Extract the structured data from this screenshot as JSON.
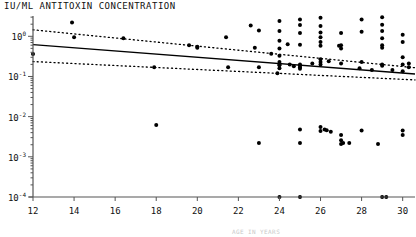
{
  "figure": {
    "title": "IU/ML  ANTITOXIN CONCENTRATION",
    "footnote": "AGE IN YEARS"
  },
  "axis_labels": {
    "y": [
      {
        "text": "10",
        "exp": "0"
      },
      {
        "text": "10",
        "exp": "-1"
      },
      {
        "text": "10",
        "exp": "-2"
      },
      {
        "text": "10",
        "exp": "-3"
      },
      {
        "text": "10",
        "exp": "-4"
      }
    ],
    "x": [
      "12",
      "14",
      "16",
      "18",
      "20",
      "22",
      "24",
      "26",
      "28",
      "30"
    ]
  },
  "colors": {
    "ink": "#111111",
    "axis": "#555555",
    "point": "#000000",
    "fit_line": "#000000",
    "ci_line": "#000000",
    "background": "#ffffff"
  },
  "chart_data": {
    "type": "scatter",
    "title": "IU/ML  ANTITOXIN CONCENTRATION",
    "xlabel": "",
    "ylabel": "IU/ML ANTITOXIN CONCENTRATION",
    "yscale": "log",
    "xlim": [
      12,
      30.6
    ],
    "ylim": [
      0.0001,
      3.2
    ],
    "xticks": [
      12,
      14,
      16,
      18,
      20,
      22,
      24,
      26,
      28,
      30
    ],
    "yticks": [
      1,
      0.1,
      0.01,
      0.001,
      0.0001
    ],
    "ytick_labels": [
      "10^0",
      "10^-1",
      "10^-2",
      "10^-3",
      "10^-4"
    ],
    "grid": false,
    "legend": null,
    "points": [
      [
        12.0,
        0.36
      ],
      [
        13.9,
        2.2
      ],
      [
        14.0,
        0.95
      ],
      [
        16.4,
        0.9
      ],
      [
        17.9,
        0.17
      ],
      [
        18.0,
        0.0062
      ],
      [
        19.6,
        0.6
      ],
      [
        20.0,
        0.52
      ],
      [
        20.0,
        0.55
      ],
      [
        21.4,
        0.95
      ],
      [
        21.5,
        0.17
      ],
      [
        22.6,
        1.85
      ],
      [
        22.8,
        0.52
      ],
      [
        23.0,
        1.4
      ],
      [
        23.0,
        0.17
      ],
      [
        23.0,
        0.0022
      ],
      [
        23.6,
        0.37
      ],
      [
        23.9,
        0.12
      ],
      [
        24.0,
        2.4
      ],
      [
        24.0,
        1.35
      ],
      [
        24.0,
        0.77
      ],
      [
        24.0,
        0.5
      ],
      [
        24.0,
        0.33
      ],
      [
        24.0,
        0.23
      ],
      [
        24.0,
        0.2
      ],
      [
        24.0,
        0.19
      ],
      [
        24.0,
        0.16
      ],
      [
        24.0,
        0.0001
      ],
      [
        24.4,
        0.63
      ],
      [
        24.5,
        0.2
      ],
      [
        24.7,
        0.18
      ],
      [
        25.0,
        2.6
      ],
      [
        25.0,
        1.9
      ],
      [
        25.0,
        1.2
      ],
      [
        25.0,
        0.62
      ],
      [
        25.0,
        0.2
      ],
      [
        25.0,
        0.185
      ],
      [
        25.0,
        0.17
      ],
      [
        25.0,
        0.155
      ],
      [
        25.0,
        0.0048
      ],
      [
        25.0,
        0.0022
      ],
      [
        25.0,
        0.0001
      ],
      [
        25.6,
        0.21
      ],
      [
        26.0,
        2.9
      ],
      [
        26.0,
        1.8
      ],
      [
        26.0,
        1.25
      ],
      [
        26.0,
        0.95
      ],
      [
        26.0,
        0.72
      ],
      [
        26.0,
        0.58
      ],
      [
        26.0,
        0.27
      ],
      [
        26.0,
        0.23
      ],
      [
        26.0,
        0.2
      ],
      [
        26.0,
        0.0055
      ],
      [
        26.0,
        0.0044
      ],
      [
        26.2,
        0.0048
      ],
      [
        26.3,
        0.0046
      ],
      [
        26.4,
        0.24
      ],
      [
        26.5,
        0.0042
      ],
      [
        26.9,
        0.58
      ],
      [
        27.0,
        1.2
      ],
      [
        27.0,
        0.6
      ],
      [
        27.0,
        0.5
      ],
      [
        27.0,
        0.21
      ],
      [
        27.0,
        0.0035
      ],
      [
        27.0,
        0.0026
      ],
      [
        27.0,
        0.0021
      ],
      [
        27.1,
        0.0022
      ],
      [
        27.4,
        0.0022
      ],
      [
        27.9,
        0.16
      ],
      [
        28.0,
        2.6
      ],
      [
        28.0,
        1.3
      ],
      [
        28.0,
        0.23
      ],
      [
        28.0,
        0.0045
      ],
      [
        28.5,
        0.145
      ],
      [
        28.8,
        0.0021
      ],
      [
        29.0,
        3.0
      ],
      [
        29.0,
        1.95
      ],
      [
        29.0,
        1.35
      ],
      [
        29.0,
        0.9
      ],
      [
        29.0,
        0.6
      ],
      [
        29.0,
        0.52
      ],
      [
        29.0,
        0.2
      ],
      [
        29.0,
        0.185
      ],
      [
        29.0,
        0.0001
      ],
      [
        29.2,
        0.0001
      ],
      [
        29.5,
        0.145
      ],
      [
        30.0,
        1.1
      ],
      [
        30.0,
        0.72
      ],
      [
        30.0,
        0.3
      ],
      [
        30.0,
        0.2
      ],
      [
        30.0,
        0.135
      ],
      [
        30.0,
        0.0045
      ],
      [
        30.0,
        0.0035
      ],
      [
        30.3,
        0.21
      ],
      [
        30.3,
        0.17
      ]
    ],
    "fit_line": {
      "style": "solid",
      "x": [
        12,
        30.6
      ],
      "y": [
        0.62,
        0.115
      ]
    },
    "confidence_upper": {
      "style": "dotted",
      "x": [
        12,
        30.6
      ],
      "y": [
        1.45,
        0.165
      ]
    },
    "confidence_lower": {
      "style": "dotted",
      "x": [
        12,
        30.6
      ],
      "y": [
        0.235,
        0.082
      ]
    }
  }
}
